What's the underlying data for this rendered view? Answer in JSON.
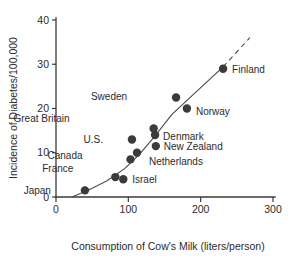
{
  "chart_data": {
    "type": "scatter",
    "title": "",
    "xlabel": "Consumption of Cow's Milk (liters/person)",
    "ylabel": "Incidence of Diabetes/100,000",
    "xlim": [
      0,
      300
    ],
    "ylim": [
      0,
      40
    ],
    "xticks": [
      "0",
      "100",
      "200",
      "300"
    ],
    "yticks": [
      "0",
      "10",
      "20",
      "30",
      "40"
    ],
    "grid": false,
    "legend": "none",
    "annotations": [
      "trend line fitted through points, extrapolated with dashes beyond Finland"
    ],
    "points": [
      {
        "label": "Japan",
        "x": 40,
        "y": 1.5,
        "label_dx": -34,
        "label_dy": 4
      },
      {
        "label": "France",
        "x": 82,
        "y": 4.5,
        "label_dx": -42,
        "label_dy": -5
      },
      {
        "label": "Israel",
        "x": 93,
        "y": 4.0,
        "label_dx": 9,
        "label_dy": 4
      },
      {
        "label": "Canada",
        "x": 103,
        "y": 8.5,
        "label_dx": -48,
        "label_dy": 0
      },
      {
        "label": "U.S.",
        "x": 105,
        "y": 13.0,
        "label_dx": -29,
        "label_dy": 4
      },
      {
        "label": "Netherlands",
        "x": 112,
        "y": 10.0,
        "label_dx": 12,
        "label_dy": 12
      },
      {
        "label": "Great Britain",
        "x": 135,
        "y": 15.5,
        "label_dx": -84,
        "label_dy": -6
      },
      {
        "label": "Denmark",
        "x": 137,
        "y": 14.0,
        "label_dx": 8,
        "label_dy": 5
      },
      {
        "label": "New Zealand",
        "x": 138,
        "y": 11.5,
        "label_dx": 8,
        "label_dy": 4
      },
      {
        "label": "Sweden",
        "x": 166,
        "y": 22.5,
        "label_dx": -49,
        "label_dy": 3
      },
      {
        "label": "Norway",
        "x": 181,
        "y": 20.0,
        "label_dx": 9,
        "label_dy": 6
      },
      {
        "label": "Finland",
        "x": 231,
        "y": 29.0,
        "label_dx": 9,
        "label_dy": 4
      }
    ],
    "trend_solid": [
      {
        "x": 22,
        "y": 0.0
      },
      {
        "x": 45,
        "y": 1.6
      },
      {
        "x": 70,
        "y": 3.6
      },
      {
        "x": 95,
        "y": 6.4
      },
      {
        "x": 115,
        "y": 9.6
      },
      {
        "x": 135,
        "y": 13.4
      },
      {
        "x": 160,
        "y": 18.6
      },
      {
        "x": 190,
        "y": 23.2
      },
      {
        "x": 231,
        "y": 29.4
      }
    ],
    "trend_dashed": [
      {
        "x": 231,
        "y": 29.4
      },
      {
        "x": 268,
        "y": 36.0
      }
    ]
  }
}
